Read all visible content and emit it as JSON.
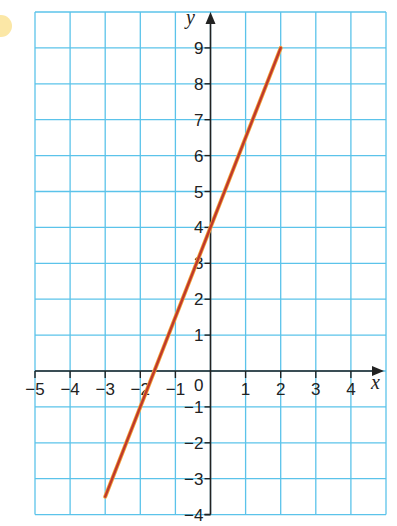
{
  "chart_data": {
    "type": "line",
    "title": "",
    "xlabel": "x",
    "ylabel": "y",
    "xlim": [
      -5,
      5
    ],
    "ylim": [
      -4,
      10
    ],
    "grid": true,
    "x_ticks": [
      "-5",
      "-4",
      "-3",
      "-2",
      "-1",
      "0",
      "1",
      "2",
      "3",
      "4"
    ],
    "y_ticks": [
      "-4",
      "-3",
      "-2",
      "-1",
      "1",
      "2",
      "3",
      "4",
      "5",
      "6",
      "7",
      "8",
      "9"
    ],
    "series": [
      {
        "name": "y = 2.5x + 4",
        "color": "#c0392b",
        "x": [
          -3,
          2
        ],
        "y": [
          -3.5,
          9
        ]
      }
    ]
  },
  "labels": {
    "x_axis": "x",
    "y_axis": "y",
    "origin": "0"
  },
  "colors": {
    "grid": "#5bc3ea",
    "axis": "#222222",
    "line": "#c0392b",
    "line_highlight": "#f2a33a"
  }
}
